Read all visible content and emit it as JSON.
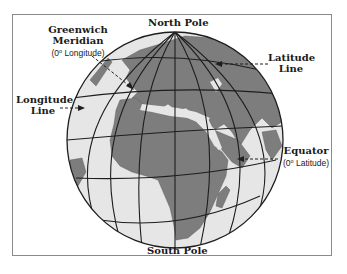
{
  "diagram": {
    "type": "globe-latitude-longitude",
    "colors": {
      "ocean": "#e6e6e6",
      "land": "#7d7d7d",
      "grid": "#1e1e1e",
      "frame": "#8a8a8a",
      "text": "#1a1a1a"
    },
    "labels": {
      "north_pole": "North Pole",
      "south_pole": "South Pole",
      "greenwich_title_1": "Greenwich",
      "greenwich_title_2": "Meridian",
      "greenwich_sub_pre": "(0",
      "greenwich_sub_deg": "o",
      "greenwich_sub_post": " Longitude)",
      "latitude_1": "Latitude",
      "latitude_2": "Line",
      "longitude_1": "Longitude",
      "longitude_2": "Line",
      "equator_title": "Equator",
      "equator_sub_pre": "(0",
      "equator_sub_deg": "o",
      "equator_sub_post": " Latitude)"
    }
  }
}
